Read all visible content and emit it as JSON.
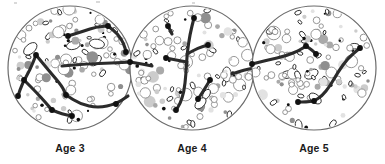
{
  "figure": {
    "kind": "scientific-diagram",
    "caption_visible": false,
    "background_color": "#ffffff",
    "panel_count": 3
  },
  "palette": {
    "dish_outline": "#6b6b6b",
    "dish_fill": "#ffffff",
    "connection_line": "#2b2b2b",
    "node_dot": "#111111",
    "label_text": "#1b1b1b",
    "cell_white": "#ffffff",
    "cell_outline": "#8a8a8a",
    "cell_gray_dark": "#8f8f8f",
    "cell_gray_mid": "#a9a9a9",
    "cell_gray_light": "#cccccc",
    "cell_gray_pale": "#e2e2e2"
  },
  "panels": [
    {
      "id": "panel-age-3",
      "label": "Age 3",
      "center": {
        "x": 70,
        "y": 68
      },
      "radius": 62,
      "label_position": {
        "x": 70,
        "y": 152
      },
      "cell_count": 118,
      "network": {
        "description": "sparse branching network, several short disconnected segments",
        "branch_count": 7,
        "node_count": 11,
        "polylines": [
          [
            [
              36,
              55
            ],
            [
              50,
              72
            ],
            [
              62,
              86
            ],
            [
              66,
              95
            ]
          ],
          [
            [
              36,
              55
            ],
            [
              30,
              70
            ],
            [
              22,
              84
            ],
            [
              18,
              96
            ]
          ],
          [
            [
              24,
              80
            ],
            [
              36,
              92
            ],
            [
              46,
              103
            ],
            [
              52,
              110
            ]
          ],
          [
            [
              68,
              36
            ],
            [
              84,
              31
            ],
            [
              96,
              27
            ],
            [
              108,
              26
            ]
          ],
          [
            [
              108,
              26
            ],
            [
              118,
              34
            ],
            [
              124,
              44
            ],
            [
              126,
              52
            ]
          ],
          [
            [
              62,
              66
            ],
            [
              86,
              64
            ],
            [
              112,
              63
            ],
            [
              132,
              62
            ]
          ],
          [
            [
              66,
              95
            ],
            [
              80,
              104
            ],
            [
              98,
              108
            ],
            [
              116,
              104
            ],
            [
              128,
              96
            ]
          ],
          [
            [
              52,
              110
            ],
            [
              62,
              114
            ],
            [
              72,
              116
            ]
          ]
        ],
        "nodes": [
          [
            36,
            55
          ],
          [
            66,
            95
          ],
          [
            18,
            96
          ],
          [
            24,
            80
          ],
          [
            52,
            110
          ],
          [
            68,
            36
          ],
          [
            108,
            26
          ],
          [
            126,
            52
          ],
          [
            132,
            62
          ],
          [
            116,
            104
          ],
          [
            72,
            116
          ]
        ]
      }
    },
    {
      "id": "panel-age-4",
      "label": "Age 4",
      "center": {
        "x": 192,
        "y": 68
      },
      "radius": 62,
      "label_position": {
        "x": 192,
        "y": 152
      },
      "cell_count": 126,
      "network": {
        "description": "dominant vertical trunk through centre with short lateral branches",
        "branch_count": 6,
        "node_count": 9,
        "polylines": [
          [
            [
              194,
              18
            ],
            [
              190,
              34
            ],
            [
              187,
              54
            ],
            [
              186,
              74
            ],
            [
              184,
              92
            ],
            [
              180,
              104
            ],
            [
              176,
              110
            ]
          ],
          [
            [
              187,
              54
            ],
            [
              198,
              48
            ],
            [
              208,
              45
            ]
          ],
          [
            [
              187,
              62
            ],
            [
              176,
              60
            ],
            [
              166,
              58
            ]
          ],
          [
            [
              210,
              80
            ],
            [
              204,
              90
            ],
            [
              198,
              99
            ]
          ],
          [
            [
              232,
              74
            ],
            [
              244,
              70
            ],
            [
              254,
              68
            ]
          ],
          [
            [
              130,
              62
            ],
            [
              142,
              64
            ],
            [
              152,
              66
            ]
          ],
          [
            [
              168,
              26
            ],
            [
              172,
              34
            ]
          ]
        ],
        "nodes": [
          [
            194,
            18
          ],
          [
            176,
            110
          ],
          [
            208,
            45
          ],
          [
            166,
            58
          ],
          [
            210,
            80
          ],
          [
            254,
            68
          ],
          [
            130,
            62
          ],
          [
            168,
            26
          ],
          [
            198,
            99
          ]
        ]
      }
    },
    {
      "id": "panel-age-5",
      "label": "Age 5",
      "center": {
        "x": 314,
        "y": 68
      },
      "radius": 62,
      "label_position": {
        "x": 314,
        "y": 152
      },
      "cell_count": 122,
      "network": {
        "description": "two long smooth arcs converging toward centre, fewer branches",
        "branch_count": 3,
        "node_count": 6,
        "polylines": [
          [
            [
              252,
              64
            ],
            [
              268,
              60
            ],
            [
              286,
              56
            ],
            [
              300,
              50
            ],
            [
              306,
              46
            ]
          ],
          [
            [
              306,
              46
            ],
            [
              312,
              50
            ],
            [
              316,
              54
            ]
          ],
          [
            [
              360,
              48
            ],
            [
              348,
              58
            ],
            [
              338,
              72
            ],
            [
              330,
              86
            ],
            [
              322,
              96
            ],
            [
              314,
              101
            ]
          ],
          [
            [
              314,
              101
            ],
            [
              306,
              102
            ],
            [
              298,
              102
            ]
          ]
        ],
        "nodes": [
          [
            252,
            64
          ],
          [
            306,
            46
          ],
          [
            360,
            48
          ],
          [
            314,
            101
          ],
          [
            298,
            102
          ],
          [
            316,
            54
          ]
        ]
      }
    }
  ],
  "artifacts": {
    "top_scan_marks": [
      {
        "x": 14,
        "y": 2,
        "w": 3,
        "h": 2
      },
      {
        "x": 96,
        "y": 1,
        "w": 4,
        "h": 2
      },
      {
        "x": 192,
        "y": 2,
        "w": 3,
        "h": 2
      }
    ]
  }
}
